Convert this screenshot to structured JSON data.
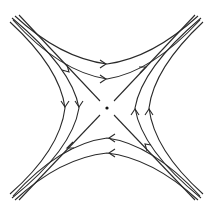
{
  "figure": {
    "type": "phase-portrait",
    "equilibrium": {
      "label": "",
      "x": 107,
      "y": 108,
      "kind": "saddle"
    },
    "colors": {
      "line": "#2a2a2a",
      "background": "#ffffff"
    },
    "separatrices": [
      {
        "name": "stable-top-left",
        "direction": "toward-center"
      },
      {
        "name": "stable-bottom-right",
        "direction": "toward-center"
      },
      {
        "name": "unstable-top-right",
        "direction": "away-from-center"
      },
      {
        "name": "unstable-bottom-left",
        "direction": "away-from-center"
      }
    ],
    "trajectory_families": [
      {
        "region": "top",
        "count": 2,
        "arrow_direction": "right"
      },
      {
        "region": "bottom",
        "count": 2,
        "arrow_direction": "left"
      },
      {
        "region": "left",
        "count": 2,
        "arrow_direction": "down"
      },
      {
        "region": "right",
        "count": 2,
        "arrow_direction": "up"
      }
    ]
  }
}
